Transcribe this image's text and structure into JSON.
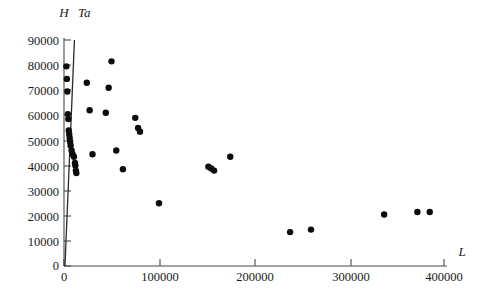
{
  "chart_data": {
    "type": "scatter",
    "title": "",
    "xlabel": "L",
    "ylabel": "H",
    "secondary_label": "Ta",
    "xlim": [
      0,
      400000
    ],
    "ylim": [
      0,
      90000
    ],
    "xticks": [
      0,
      100000,
      200000,
      300000,
      400000
    ],
    "yticks": [
      0,
      10000,
      20000,
      30000,
      40000,
      50000,
      60000,
      70000,
      80000,
      90000
    ],
    "xtick_labels": [
      "0",
      "100000",
      "200000",
      "300000",
      "400000"
    ],
    "ytick_labels": [
      "0",
      "10000",
      "20000",
      "30000",
      "40000",
      "50000",
      "60000",
      "70000",
      "80000",
      "90000"
    ],
    "grid": false,
    "legend": "none",
    "marker": "filled-circle",
    "marker_color": "#0d0d0d",
    "points": [
      [
        2500,
        79500
      ],
      [
        3000,
        74500
      ],
      [
        3500,
        69500
      ],
      [
        4000,
        60500
      ],
      [
        4500,
        58500
      ],
      [
        5000,
        54000
      ],
      [
        5500,
        52500
      ],
      [
        6000,
        51000
      ],
      [
        6500,
        49500
      ],
      [
        7000,
        48000
      ],
      [
        8000,
        46000
      ],
      [
        9000,
        44500
      ],
      [
        10500,
        43500
      ],
      [
        11500,
        41000
      ],
      [
        12000,
        40000
      ],
      [
        12500,
        38000
      ],
      [
        13000,
        37000
      ],
      [
        24000,
        73000
      ],
      [
        27000,
        62000
      ],
      [
        30000,
        44500
      ],
      [
        50000,
        81500
      ],
      [
        47000,
        71000
      ],
      [
        44000,
        61000
      ],
      [
        55000,
        46000
      ],
      [
        62000,
        38500
      ],
      [
        75000,
        59000
      ],
      [
        78000,
        55000
      ],
      [
        80000,
        53500
      ],
      [
        100000,
        25000
      ],
      [
        152000,
        39500
      ],
      [
        155000,
        38800
      ],
      [
        158000,
        38000
      ],
      [
        175000,
        43500
      ],
      [
        238000,
        13500
      ],
      [
        260000,
        14500
      ],
      [
        337000,
        20500
      ],
      [
        372000,
        21500
      ],
      [
        385000,
        21500
      ]
    ],
    "trend_line": {
      "description": "steep near-vertical line labelled Ta rising from origin",
      "from": [
        1000,
        0
      ],
      "to": [
        11000,
        90000
      ]
    }
  }
}
